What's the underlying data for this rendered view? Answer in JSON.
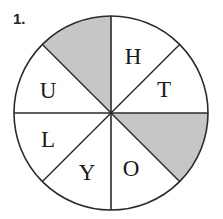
{
  "problem_number": "1.",
  "wheel": {
    "shade_color": "#c6c6c6",
    "line_color": "#2a2a2a",
    "sectors": [
      {
        "position": "top-left",
        "letter": "",
        "shaded": true
      },
      {
        "position": "top-right",
        "letter": "H",
        "shaded": false
      },
      {
        "position": "right-upper",
        "letter": "T",
        "shaded": false
      },
      {
        "position": "right-lower",
        "letter": "",
        "shaded": true
      },
      {
        "position": "bottom-right",
        "letter": "O",
        "shaded": false
      },
      {
        "position": "bottom-left",
        "letter": "Y",
        "shaded": false
      },
      {
        "position": "left-lower",
        "letter": "L",
        "shaded": false
      },
      {
        "position": "left-upper",
        "letter": "U",
        "shaded": false
      }
    ]
  }
}
